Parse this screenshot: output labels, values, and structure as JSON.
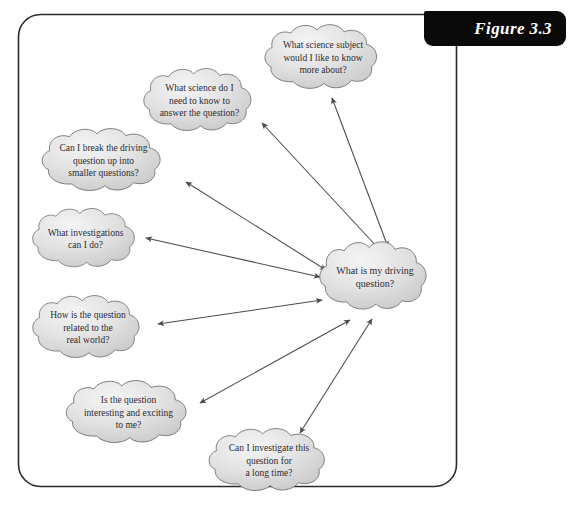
{
  "figure": {
    "tab_label": "Figure 3.3",
    "frame": {
      "x": 18,
      "y": 14,
      "width": 438,
      "height": 472,
      "corner_radius": 22,
      "stroke_color": "#2a2a2a"
    },
    "caption_sliver": "",
    "colors": {
      "cloud_fill_light": "#f0f0f0",
      "cloud_fill_dark": "#cfcfcf",
      "cloud_stroke": "#6e6e72",
      "arrow_color": "#4a4a50",
      "text_color": "#2b2b33",
      "tab_background": "#0a0a0a",
      "tab_text": "#ffffff"
    }
  },
  "central_node": {
    "id": "driving-question",
    "text": "What is my driving\nquestion?",
    "x": 316,
    "y": 239,
    "width": 118,
    "height": 76
  },
  "nodes": [
    {
      "id": "science-subject",
      "text": "What science subject\nwould I like to know\nmore about?",
      "x": 261,
      "y": 22,
      "width": 124,
      "height": 72
    },
    {
      "id": "science-needed",
      "text": "What science do I\nneed to know to\nanswer the question?",
      "x": 140,
      "y": 66,
      "width": 119,
      "height": 70
    },
    {
      "id": "break-into-smaller",
      "text": "Can I break the driving\nquestion up into\nsmaller questions?",
      "x": 38,
      "y": 126,
      "width": 131,
      "height": 70
    },
    {
      "id": "investigations",
      "text": "What investigations\ncan I do?",
      "x": 29,
      "y": 206,
      "width": 113,
      "height": 66
    },
    {
      "id": "real-world",
      "text": "How is the question\nrelated to the\nreal world?",
      "x": 29,
      "y": 293,
      "width": 118,
      "height": 70
    },
    {
      "id": "interesting-exciting",
      "text": "Is the question\ninteresting and exciting\nto me?",
      "x": 62,
      "y": 378,
      "width": 133,
      "height": 70
    },
    {
      "id": "long-time",
      "text": "Can I investigate this\nquestion for\na long time?",
      "x": 205,
      "y": 426,
      "width": 128,
      "height": 70
    }
  ],
  "connectors": [
    {
      "id": "link-science-subject",
      "from": "science-subject",
      "x1": 332,
      "y1": 98,
      "x2": 388,
      "y2": 247,
      "double_headed": true
    },
    {
      "id": "link-science-needed",
      "from": "science-needed",
      "x1": 262,
      "y1": 123,
      "x2": 379,
      "y2": 249,
      "double_headed": true
    },
    {
      "id": "link-break-into-smaller",
      "from": "break-into-smaller",
      "x1": 186,
      "y1": 182,
      "x2": 326,
      "y2": 270,
      "double_headed": true
    },
    {
      "id": "link-investigations",
      "from": "investigations",
      "x1": 146,
      "y1": 238,
      "x2": 320,
      "y2": 277,
      "double_headed": true
    },
    {
      "id": "link-real-world",
      "from": "real-world",
      "x1": 158,
      "y1": 324,
      "x2": 322,
      "y2": 300,
      "double_headed": true
    },
    {
      "id": "link-interesting-exciting",
      "from": "interesting-exciting",
      "x1": 200,
      "y1": 403,
      "x2": 350,
      "y2": 320,
      "double_headed": true
    },
    {
      "id": "link-long-time",
      "from": "long-time",
      "x1": 300,
      "y1": 433,
      "x2": 372,
      "y2": 319,
      "double_headed": true
    }
  ]
}
